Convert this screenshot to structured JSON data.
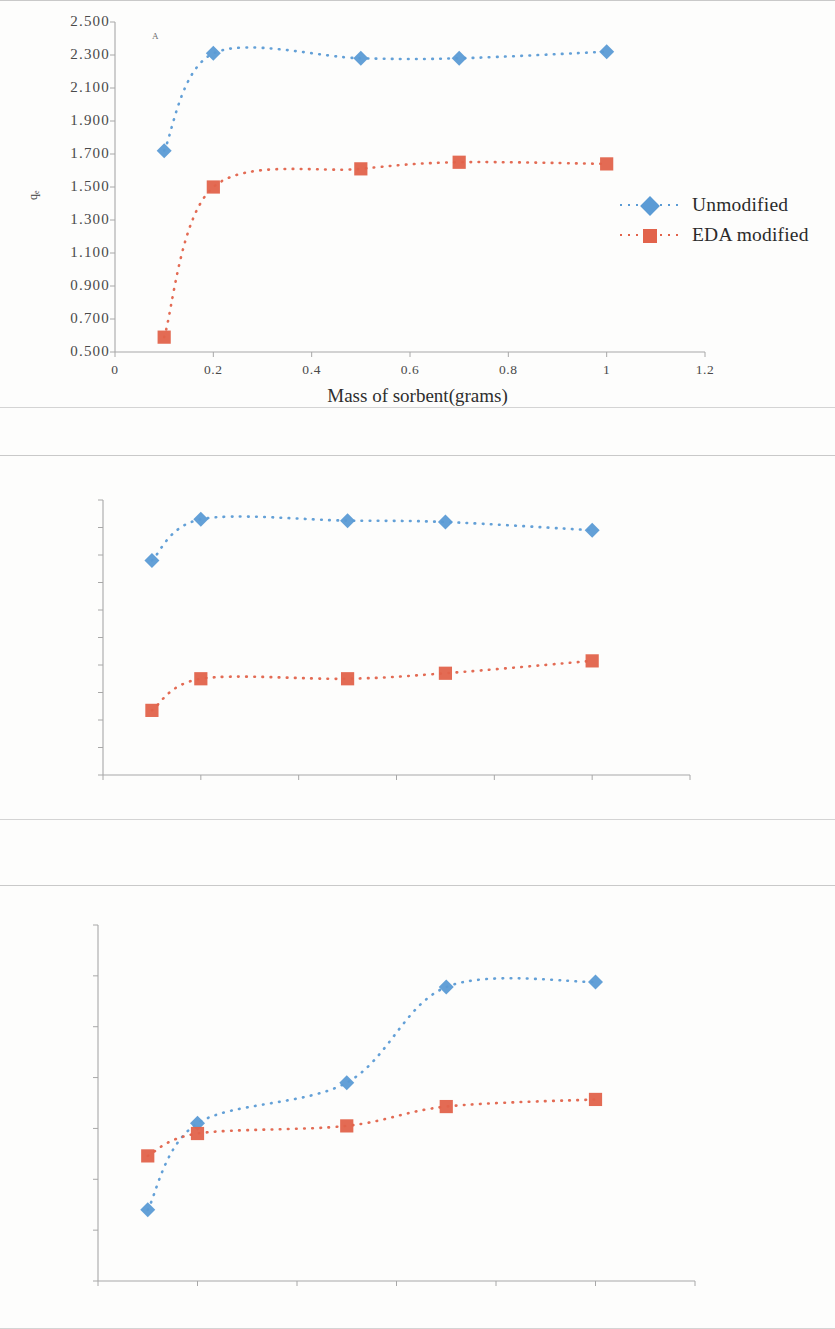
{
  "colors": {
    "series_blue": "#5B9BD5",
    "series_red": "#E2634B",
    "axis": "#9a9a9a",
    "text": "#3a3a3a"
  },
  "panels": [
    {
      "letter": "A",
      "xlabel": "Mass of sorbent(grams)",
      "ylabel": "q",
      "ylabel_sub": "e",
      "yticks": [
        "0.500",
        "0.700",
        "0.900",
        "1.100",
        "1.300",
        "1.500",
        "1.700",
        "1.900",
        "2.100",
        "2.300",
        "2.500"
      ],
      "xticks": [
        "0",
        "0.2",
        "0.4",
        "0.6",
        "0.8",
        "1",
        "1.2"
      ],
      "legend": [
        {
          "label": "Unmodified",
          "marker": "diamond",
          "color": "#5B9BD5"
        },
        {
          "label": "EDA modified",
          "marker": "square",
          "color": "#E2634B"
        }
      ]
    },
    {
      "letter": "B",
      "xlabel": "Mass of sorbent (grams)",
      "ylabel": "q",
      "ylabel_sub": "e",
      "yticks": [
        "0.5",
        "0.7",
        "0.9",
        "1.1",
        "1.3",
        "1.5",
        "1.7",
        "1.9",
        "2.1",
        "2.3",
        "2.5"
      ],
      "xticks": [
        "0",
        "0.2",
        "0.4",
        "0.6",
        "0.8",
        "1",
        "1.2"
      ],
      "legend": [
        {
          "label": "Unmodified",
          "marker": "diamond",
          "color": "#5B9BD5"
        },
        {
          "label": "EDA modified",
          "marker": "square",
          "color": "#E2634B"
        }
      ]
    },
    {
      "letter": "C",
      "xlabel": "Sorbent dose (grams)",
      "ylabel": "q",
      "ylabel_sub": "e",
      "yticks": [
        "1.8",
        "1.9",
        "2",
        "2.1",
        "2.2",
        "2.3",
        "2.4",
        "2.5"
      ],
      "xticks": [
        "0",
        "0.2",
        "0.4",
        "0.6",
        "0.8",
        "1",
        "1.2"
      ],
      "legend": [
        {
          "label": "Unmodified",
          "marker": "diamond",
          "color": "#5B9BD5"
        },
        {
          "label": "Modified",
          "marker": "square",
          "color": "#E2634B"
        }
      ]
    }
  ],
  "chart_data": [
    {
      "type": "line",
      "panel": "A",
      "title": "",
      "xlabel": "Mass of sorbent(grams)",
      "ylabel": "qe",
      "xlim": [
        0,
        1.2
      ],
      "ylim": [
        0.5,
        2.5
      ],
      "xticks": [
        0,
        0.2,
        0.4,
        0.6,
        0.8,
        1,
        1.2
      ],
      "yticks": [
        0.5,
        0.7,
        0.9,
        1.1,
        1.3,
        1.5,
        1.7,
        1.9,
        2.1,
        2.3,
        2.5
      ],
      "grid": false,
      "legend_position": "right",
      "x": [
        0.1,
        0.2,
        0.5,
        0.7,
        1.0
      ],
      "series": [
        {
          "name": "Unmodified",
          "marker": "diamond",
          "color": "#5B9BD5",
          "values": [
            1.72,
            2.31,
            2.28,
            2.28,
            2.32
          ]
        },
        {
          "name": "EDA modified",
          "marker": "square",
          "color": "#E2634B",
          "values": [
            0.59,
            1.5,
            1.61,
            1.65,
            1.64
          ]
        }
      ]
    },
    {
      "type": "line",
      "panel": "B",
      "title": "",
      "xlabel": "Mass of sorbent (grams)",
      "ylabel": "qe",
      "xlim": [
        0,
        1.2
      ],
      "ylim": [
        0.5,
        2.5
      ],
      "xticks": [
        0,
        0.2,
        0.4,
        0.6,
        0.8,
        1,
        1.2
      ],
      "yticks": [
        0.5,
        0.7,
        0.9,
        1.1,
        1.3,
        1.5,
        1.7,
        1.9,
        2.1,
        2.3,
        2.5
      ],
      "grid": false,
      "legend_position": "right",
      "x": [
        0.1,
        0.2,
        0.5,
        0.7,
        1.0
      ],
      "series": [
        {
          "name": "Unmodified",
          "marker": "diamond",
          "color": "#5B9BD5",
          "values": [
            2.06,
            2.36,
            2.35,
            2.34,
            2.28
          ]
        },
        {
          "name": "EDA modified",
          "marker": "square",
          "color": "#E2634B",
          "values": [
            0.97,
            1.2,
            1.2,
            1.24,
            1.33
          ]
        }
      ]
    },
    {
      "type": "line",
      "panel": "C",
      "title": "",
      "xlabel": "Sorbent dose (grams)",
      "ylabel": "qe",
      "xlim": [
        0,
        1.2
      ],
      "ylim": [
        1.8,
        2.5
      ],
      "xticks": [
        0,
        0.2,
        0.4,
        0.6,
        0.8,
        1,
        1.2
      ],
      "yticks": [
        1.8,
        1.9,
        2,
        2.1,
        2.2,
        2.3,
        2.4,
        2.5
      ],
      "grid": false,
      "legend_position": "right",
      "x": [
        0.1,
        0.2,
        0.5,
        0.7,
        1.0
      ],
      "series": [
        {
          "name": "Unmodified",
          "marker": "diamond",
          "color": "#5B9BD5",
          "values": [
            1.94,
            2.11,
            2.19,
            2.378,
            2.388
          ]
        },
        {
          "name": "Modified",
          "marker": "square",
          "color": "#E2634B",
          "values": [
            2.046,
            2.09,
            2.105,
            2.143,
            2.157
          ]
        }
      ]
    }
  ]
}
